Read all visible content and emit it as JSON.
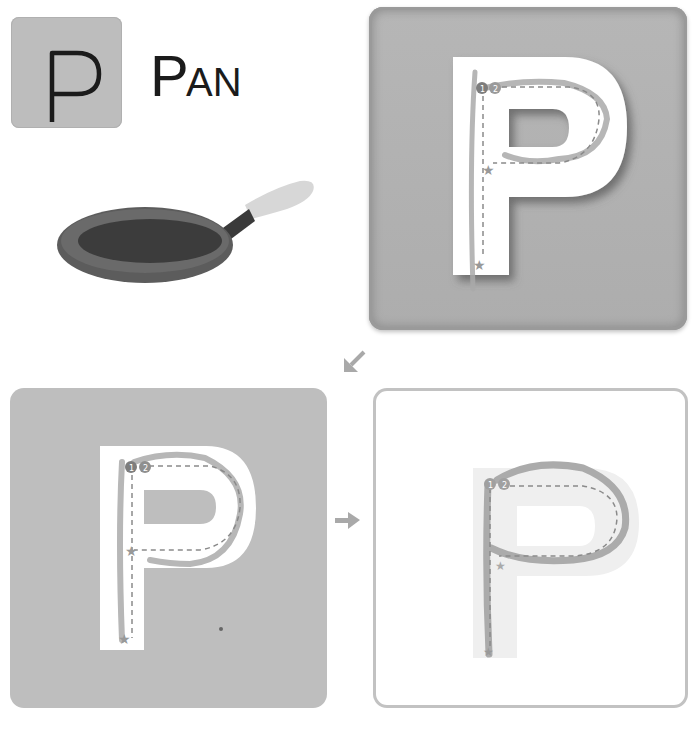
{
  "letter_tile": {
    "letter": "P",
    "bg_color": "#bdbdbd"
  },
  "word": {
    "first": "P",
    "rest": "AN",
    "full": "PAN"
  },
  "illustration": {
    "name": "frying-pan"
  },
  "practice_cards": [
    {
      "id": "guide",
      "letter": "P",
      "style": "embossed-gray",
      "stroke_markers": [
        "1",
        "2"
      ]
    },
    {
      "id": "trace-gray",
      "letter": "P",
      "style": "gray-background",
      "stroke_markers": [
        "1",
        "2"
      ]
    },
    {
      "id": "trace-white",
      "letter": "P",
      "style": "white-background-outlined",
      "stroke_markers": [
        "1",
        "2"
      ]
    }
  ],
  "arrows": {
    "down_left": "↙",
    "right": "→"
  },
  "colors": {
    "tile_gray": "#bdbdbd",
    "card_gray": "#bebebe",
    "card_border": "#c2c2c2",
    "trace": "#9e9e9e",
    "guide_dash": "#8a8a8a"
  }
}
